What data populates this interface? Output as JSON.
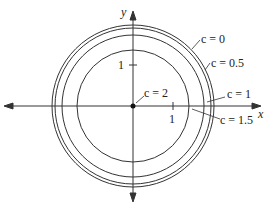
{
  "figure": {
    "axis_x_label": "x",
    "axis_y_label": "y",
    "tick_x_label": "1",
    "tick_y_label": "1",
    "center_label": "c = 2"
  },
  "curves": [
    {
      "label": "c = 0",
      "radius_units": 2.0
    },
    {
      "label": "c = 0.5",
      "radius_units": 1.94
    },
    {
      "label": "c = 1",
      "radius_units": 1.77
    },
    {
      "label": "c = 1.5",
      "radius_units": 1.39
    }
  ],
  "colors": {
    "ink": "#222222",
    "background": "#ffffff"
  }
}
